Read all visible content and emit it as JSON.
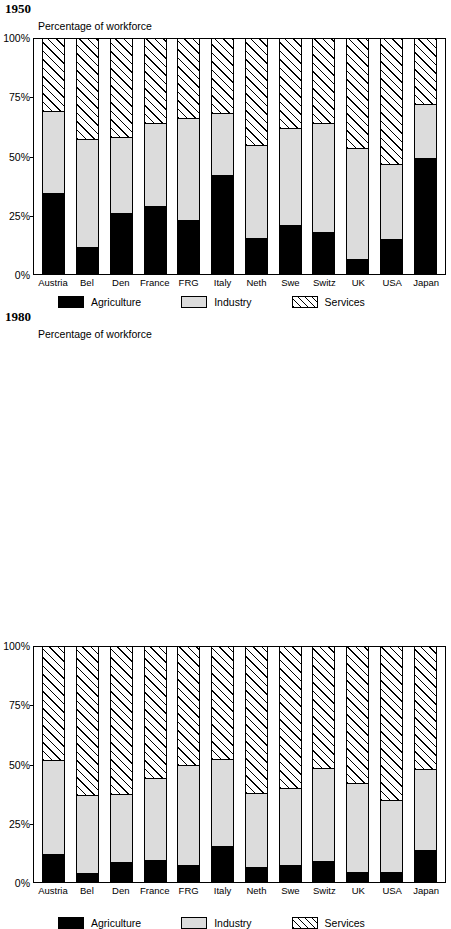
{
  "panels": [
    {
      "year": "1950",
      "axis_title": "Percentage of workforce",
      "yticks": [
        "100%",
        "75%",
        "50%",
        "25%",
        "0%"
      ]
    },
    {
      "year": "1980",
      "axis_title": "Percentage of workforce",
      "yticks": [
        "100%",
        "75%",
        "50%",
        "25%",
        "0%"
      ]
    }
  ],
  "legend": {
    "items": [
      {
        "label": "Agriculture",
        "swatch": "solid-black-swatch",
        "color": "#000000"
      },
      {
        "label": "Industry",
        "swatch": "light-grey-swatch",
        "color": "#dcdcdc"
      },
      {
        "label": "Services",
        "swatch": "diagonal-hatch-swatch",
        "color": "#ffffff"
      }
    ]
  },
  "chart_data": [
    {
      "type": "bar",
      "title": "1950",
      "subtitle": "Percentage of workforce",
      "stacked": true,
      "stack_total": 100,
      "xlabel": "",
      "ylabel": "Percentage of workforce",
      "ylim": [
        0,
        100
      ],
      "yticks": [
        0,
        25,
        50,
        75,
        100
      ],
      "ytick_labels": [
        "0%",
        "25%",
        "50%",
        "75%",
        "100%"
      ],
      "grid": false,
      "legend_position": "bottom",
      "categories": [
        "Austria",
        "Bel",
        "Den",
        "France",
        "FRG",
        "Italy",
        "Neth",
        "Swe",
        "Switz",
        "UK",
        "USA",
        "Japan"
      ],
      "series": [
        {
          "name": "Agriculture",
          "values": [
            34,
            11,
            25.5,
            28.5,
            22.5,
            41.5,
            15,
            20.5,
            17.5,
            6,
            14.5,
            49
          ]
        },
        {
          "name": "Industry",
          "values": [
            35,
            46,
            32.5,
            35.5,
            43.5,
            26.5,
            39.5,
            41,
            46.5,
            47,
            32,
            23
          ]
        },
        {
          "name": "Services",
          "values": [
            31,
            43,
            42,
            36,
            34,
            32,
            45.5,
            38.5,
            36,
            47,
            53.5,
            28
          ]
        }
      ],
      "cumulative_tops": {
        "agriculture": [
          34,
          11,
          25.5,
          28.5,
          22.5,
          41.5,
          15,
          20.5,
          17.5,
          6,
          14.5,
          49
        ],
        "industry": [
          69,
          57,
          58,
          64,
          66,
          68,
          54.5,
          61.5,
          64,
          53,
          46.5,
          72
        ]
      }
    },
    {
      "type": "bar",
      "title": "1980",
      "subtitle": "Percentage of workforce",
      "stacked": true,
      "stack_total": 100,
      "xlabel": "",
      "ylabel": "Percentage of workforce",
      "ylim": [
        0,
        100
      ],
      "yticks": [
        0,
        25,
        50,
        75,
        100
      ],
      "ytick_labels": [
        "0%",
        "25%",
        "50%",
        "75%",
        "100%"
      ],
      "grid": false,
      "legend_position": "bottom",
      "categories": [
        "Austria",
        "Bel",
        "Den",
        "France",
        "FRG",
        "Italy",
        "Neth",
        "Swe",
        "Switz",
        "UK",
        "USA",
        "Japan"
      ],
      "series": [
        {
          "name": "Agriculture",
          "values": [
            11.5,
            3.5,
            8,
            9,
            7,
            15,
            6,
            7,
            8.5,
            4,
            4,
            13
          ]
        },
        {
          "name": "Industry",
          "values": [
            40,
            33,
            29,
            35,
            42.5,
            37,
            31.5,
            32.5,
            39.5,
            37.5,
            30.5,
            34.5
          ]
        },
        {
          "name": "Services",
          "values": [
            48.5,
            63.5,
            63,
            56,
            50.5,
            48,
            62.5,
            60.5,
            52,
            58.5,
            65.5,
            52.5
          ]
        }
      ],
      "cumulative_tops": {
        "agriculture": [
          11.5,
          3.5,
          8,
          9,
          7,
          15,
          6,
          7,
          8.5,
          4,
          4,
          13
        ],
        "industry": [
          51.5,
          36.5,
          37,
          44,
          49.5,
          52,
          37.5,
          39.5,
          48,
          41.5,
          34.5,
          47.5
        ]
      }
    }
  ]
}
